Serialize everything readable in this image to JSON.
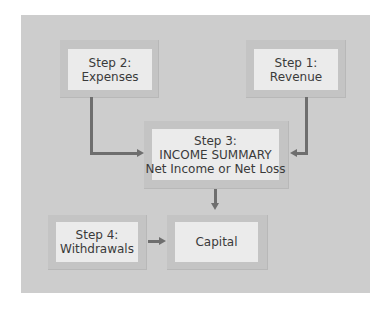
{
  "diagram": {
    "nodes": {
      "step2": {
        "line1": "Step 2:",
        "line2": "Expenses"
      },
      "step1": {
        "line1": "Step 1:",
        "line2": "Revenue"
      },
      "step3": {
        "line1": "Step 3:",
        "line2": "INCOME SUMMARY",
        "line3": "Net Income or Net Loss"
      },
      "step4": {
        "line1": "Step 4:",
        "line2": "Withdrawals"
      },
      "capital": {
        "line1": "Capital"
      }
    },
    "edges": [
      {
        "from": "step2",
        "to": "step3"
      },
      {
        "from": "step1",
        "to": "step3"
      },
      {
        "from": "step3",
        "to": "capital"
      },
      {
        "from": "step4",
        "to": "capital"
      }
    ],
    "colors": {
      "panel": "#cdcdcd",
      "box": "#ebebeb",
      "box_frame": "#c4c4c4",
      "arrow": "#6e6e6e",
      "text": "#3a3a3a"
    }
  }
}
